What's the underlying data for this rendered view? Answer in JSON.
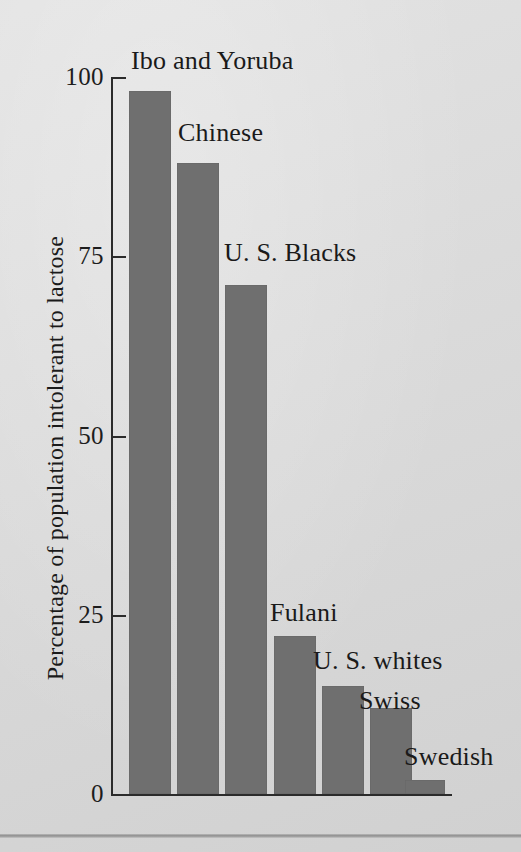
{
  "chart_data": {
    "type": "bar",
    "title": "",
    "xlabel": "",
    "ylabel": "Percentage of population intolerant to lactose",
    "ylim": [
      0,
      100
    ],
    "yticks": [
      0,
      25,
      50,
      75,
      100
    ],
    "ytick_labels": [
      "0",
      "25",
      "50",
      "75",
      "100"
    ],
    "grid": false,
    "legend": "none",
    "bar_color": "#6f6f6f",
    "background_color": "#dcdcdc",
    "axis_color": "#2b2b2b",
    "categories": [
      "Ibo and Yoruba",
      "Chinese",
      "U. S. Blacks",
      "Fulani",
      "U. S. whites",
      "Swiss",
      "Swedish"
    ],
    "values": [
      98,
      88,
      71,
      22,
      15,
      12,
      2
    ],
    "annotations": [
      "Ibo and Yoruba",
      "Chinese",
      "U. S. Blacks",
      "Fulani",
      "U. S. whites",
      "Swiss",
      "Swedish"
    ]
  },
  "labels": {
    "ytick_0": "0",
    "ytick_25": "25",
    "ytick_50": "50",
    "ytick_75": "75",
    "ytick_100": "100",
    "bar_0": "Ibo and Yoruba",
    "bar_1": "Chinese",
    "bar_2": "U. S. Blacks",
    "bar_3": "Fulani",
    "bar_4": "U. S. whites",
    "bar_5": "Swiss",
    "bar_6": "Swedish",
    "ylabel": "Percentage of population intolerant to lactose"
  }
}
